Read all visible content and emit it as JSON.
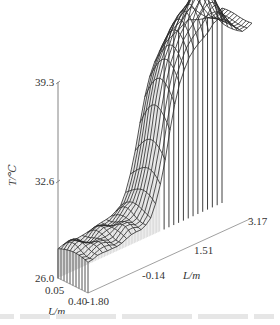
{
  "chart_data": {
    "type": "surface3d",
    "title": "",
    "zlabel": "T/℃",
    "z_ticks": [
      "26.0",
      "32.6",
      "39.3"
    ],
    "zlim": [
      26.0,
      39.3
    ],
    "axis_long": {
      "label": "L/m",
      "ticks": [
        "-1.80",
        "-0.14",
        "1.51",
        "3.17"
      ],
      "range": [
        -1.8,
        3.17
      ]
    },
    "axis_short": {
      "label": "L/m",
      "ticks": [
        "0.05",
        "0.40"
      ],
      "range": [
        0.05,
        0.4
      ]
    },
    "grid": false,
    "rows": 10,
    "cols": 34,
    "profile_long": {
      "x": [
        -1.8,
        -1.5,
        -1.2,
        -0.9,
        -0.6,
        -0.3,
        -0.14,
        0.1,
        0.3,
        0.5,
        0.7,
        0.9,
        1.1,
        1.3,
        1.51,
        1.7,
        1.9,
        2.1,
        2.3,
        2.5,
        2.7,
        2.9,
        3.17
      ],
      "T_front": [
        28.3,
        28.6,
        28.4,
        28.6,
        28.8,
        28.9,
        29.0,
        29.6,
        30.8,
        33.0,
        36.0,
        38.2,
        39.3,
        40.5,
        41.2,
        41.6,
        42.2,
        43.4,
        41.8,
        40.6,
        39.6,
        39.0,
        39.3
      ],
      "T_back": [
        28.0,
        28.2,
        28.1,
        28.2,
        28.4,
        28.5,
        28.6,
        29.0,
        30.0,
        31.8,
        34.2,
        36.4,
        37.6,
        38.4,
        38.8,
        39.0,
        39.2,
        39.6,
        39.4,
        39.2,
        39.1,
        39.0,
        39.3
      ]
    }
  },
  "labels": {
    "z_axis": "T/℃",
    "z_tick_0": "26.0",
    "z_tick_1": "32.6",
    "z_tick_2": "39.3",
    "long_tick_0": "-1.80",
    "long_tick_1": "-0.14",
    "long_tick_2": "1.51",
    "long_tick_3": "3.17",
    "long_axis": "L/m",
    "short_tick_0": "0.05",
    "short_tick_1": "0.40",
    "short_axis": "L/m"
  },
  "colors": {
    "wire": "#2a2a2a",
    "axis": "#555555",
    "background": "#ffffff"
  }
}
